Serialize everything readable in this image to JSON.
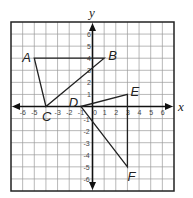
{
  "diagram": {
    "type": "coordinate-plane",
    "x_axis_label": "x",
    "y_axis_label": "y",
    "x_range": [
      -7,
      7
    ],
    "y_range": [
      -7,
      7
    ],
    "x_ticks": [
      -6,
      -5,
      -4,
      -3,
      -2,
      -1,
      0,
      1,
      2,
      3,
      4,
      5,
      6
    ],
    "y_ticks": [
      -6,
      -5,
      -4,
      -3,
      -2,
      -1,
      1,
      2,
      3,
      4,
      5,
      6
    ],
    "x_tick_labels": [
      "-6",
      "-5",
      "-3",
      "-2",
      "-1",
      "0",
      "1",
      "2",
      "3",
      "4",
      "5",
      "6"
    ],
    "y_tick_labels": [
      "6",
      "5",
      "4",
      "3",
      "2",
      "1",
      "-1",
      "-2",
      "-3",
      "-4",
      "-5",
      "-6"
    ],
    "points": [
      {
        "name": "A",
        "x": -5,
        "y": 4
      },
      {
        "name": "B",
        "x": 1,
        "y": 4
      },
      {
        "name": "C",
        "x": -4,
        "y": 0
      },
      {
        "name": "D",
        "x": -1,
        "y": 0
      },
      {
        "name": "E",
        "x": 3,
        "y": 1
      },
      {
        "name": "F",
        "x": 3,
        "y": -5
      }
    ],
    "triangles": [
      {
        "name": "ABC",
        "vertices": [
          "A",
          "B",
          "C"
        ]
      },
      {
        "name": "DEF",
        "vertices": [
          "D",
          "E",
          "F"
        ]
      }
    ],
    "colors": {
      "grid": "#999999",
      "border": "#222222",
      "axis": "#111111",
      "shape": "#222222"
    }
  }
}
